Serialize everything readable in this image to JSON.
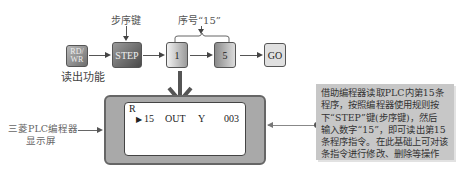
{
  "keys": {
    "rdwr_line1": "RD/",
    "rdwr_line2": "WR",
    "step": "STEP",
    "digit1": "1",
    "digit5": "5",
    "go": "GO"
  },
  "labels": {
    "read_function": "读出功能",
    "step_key": "步序键",
    "sequence_number": "序号“15”",
    "display_screen_line1": "三菱PLC编程器",
    "display_screen_line2": "显示屏"
  },
  "screen": {
    "mode": "R",
    "cursor": "▶",
    "step_no": "15",
    "instruction": "OUT",
    "device": "Y",
    "address": "003"
  },
  "note": {
    "lines": [
      "借助编程器读取PLC内第15条",
      "程序，按照编程器使用规则按",
      "下“STEP”键(步序键)，然后",
      "输入数字“15”，即可读出第15",
      "条程序指令。在此基础上可对该",
      "条指令进行修改、删除等操作"
    ]
  },
  "colors": {
    "note_bg": "#c7c7c7",
    "screen_frame": "#a9a9a9",
    "step_key": "#4a4a4a"
  }
}
